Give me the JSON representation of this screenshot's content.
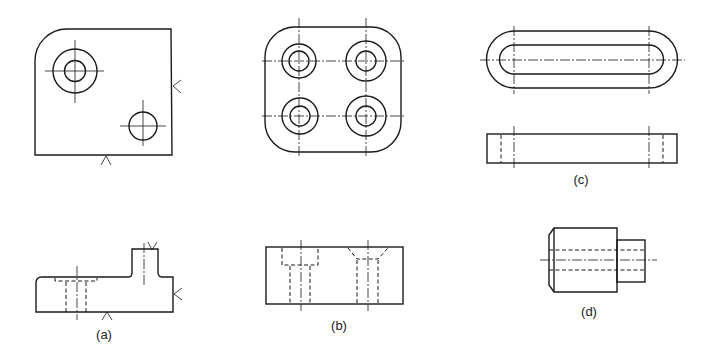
{
  "figure": {
    "colors": {
      "line": "#1a1a1a",
      "background": "#ffffff"
    },
    "parts": [
      {
        "id": "a",
        "label": "(a)",
        "views": [
          "plan view with rounded corner, counterbored hole and plain hole",
          "front elevation with boss and hidden counterbore"
        ],
        "machining_marks": 4
      },
      {
        "id": "b",
        "label": "(b)",
        "views": [
          "plan view rounded square with four holes",
          "front elevation with counterbored and countersunk hidden holes"
        ]
      },
      {
        "id": "c",
        "label": "(c)",
        "views": [
          "plan view slotted link",
          "front elevation with hidden slot ends"
        ]
      },
      {
        "id": "d",
        "label": "(d)",
        "views": [
          "stepped shaft with chamfer and hidden bore"
        ]
      }
    ]
  }
}
